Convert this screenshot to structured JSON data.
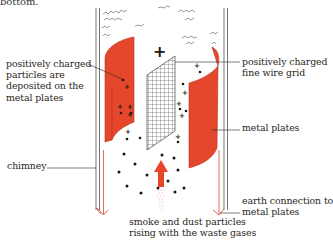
{
  "intro": {
    "text": "bottom."
  },
  "labels": {
    "particles_deposited": [
      "positively charged",
      "particles are",
      "deposited on the",
      "metal plates"
    ],
    "wire_grid": [
      "positively charged",
      "fine wire grid"
    ],
    "metal_plates": [
      "metal plates"
    ],
    "chimney": [
      "chimney"
    ],
    "earth_connection": [
      "earth connection to",
      "metal plates"
    ],
    "smoke_dust": [
      "smoke and dust particles",
      "rising with the waste gases"
    ]
  },
  "symbols": {
    "grid_charge": "+",
    "particle_charge": "+"
  },
  "colors": {
    "plate": "#e4472b",
    "plate_edge": "#b8321c",
    "earth_wire": "#e0463a",
    "chimney_wall": "#555050",
    "arrow": "#e8452a",
    "text": "#2a2622"
  }
}
